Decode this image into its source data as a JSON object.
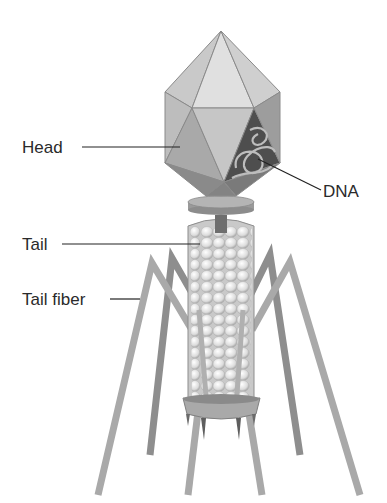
{
  "diagram": {
    "labels": [
      {
        "id": "head",
        "text": "Head"
      },
      {
        "id": "dna",
        "text": "DNA"
      },
      {
        "id": "tail",
        "text": "Tail"
      },
      {
        "id": "tail_fiber",
        "text": "Tail fiber"
      }
    ],
    "colors": {
      "background": "#ffffff",
      "head_light": "#d9d9d9",
      "head_mid": "#b5b5b5",
      "head_dark": "#8c8c8c",
      "dna_bg": "#4a4a4a",
      "tail_bead": "#ececec",
      "fiber": "#a6a6a6",
      "fiber_dark": "#8a8a8a",
      "leader": "#222222",
      "text": "#2a2a2a"
    }
  }
}
